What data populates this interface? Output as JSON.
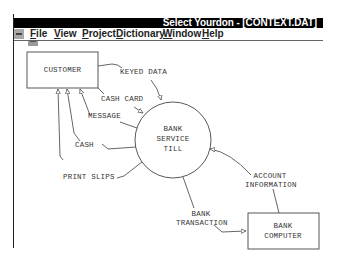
{
  "window": {
    "title": "Select Yourdon - [CONTEXT.DAT]"
  },
  "menubar": {
    "items": [
      {
        "label": "File",
        "accel": "F",
        "rest": "ile"
      },
      {
        "label": "View",
        "accel": "V",
        "rest": "iew"
      },
      {
        "label": "Project",
        "accel": "P",
        "rest": "roject"
      },
      {
        "label": "Dictionary",
        "accel": "D",
        "rest": "ictionary"
      },
      {
        "label": "Window",
        "accel": "W",
        "rest": "indow"
      },
      {
        "label": "Help",
        "accel": "H",
        "rest": "elp"
      }
    ]
  },
  "diagram": {
    "type": "context data flow diagram",
    "terminators": [
      {
        "id": "customer",
        "label": "CUSTOMER"
      },
      {
        "id": "bank_computer",
        "label_line1": "BANK",
        "label_line2": "COMPUTER"
      }
    ],
    "process": {
      "label_line1": "BANK",
      "label_line2": "SERVICE",
      "label_line3": "TILL"
    },
    "flows": [
      {
        "label": "KEYED DATA",
        "from": "CUSTOMER",
        "to": "BANK SERVICE TILL"
      },
      {
        "label": "CASH CARD",
        "from": "CUSTOMER",
        "to": "BANK SERVICE TILL"
      },
      {
        "label": "MESSAGE",
        "from": "BANK SERVICE TILL",
        "to": "CUSTOMER"
      },
      {
        "label": "CASH",
        "from": "BANK SERVICE TILL",
        "to": "CUSTOMER"
      },
      {
        "label": "PRINT SLIPS",
        "from": "BANK SERVICE TILL",
        "to": "CUSTOMER"
      },
      {
        "label_line1": "ACCOUNT",
        "label_line2": "INFORMATION",
        "from": "BANK COMPUTER",
        "to": "BANK SERVICE TILL"
      },
      {
        "label_line1": "BANK",
        "label_line2": "TRANSACTION",
        "from": "BANK SERVICE TILL",
        "to": "BANK COMPUTER"
      }
    ]
  }
}
